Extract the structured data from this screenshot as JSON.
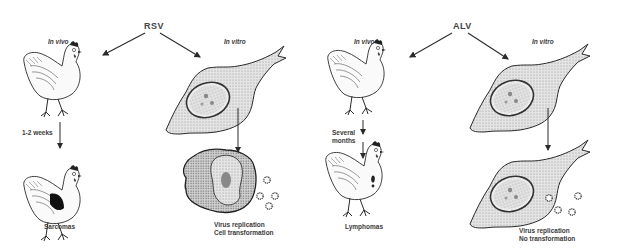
{
  "panels": [
    {
      "virus": "RSV",
      "in_vivo_label": "In vivo",
      "in_vitro_label": "In vitro",
      "time_label": "1-2 weeks",
      "vivo_outcome": "Sarcomas",
      "vitro_outcome_line1": "Virus replication",
      "vitro_outcome_line2": "Cell transformation"
    },
    {
      "virus": "ALV",
      "in_vivo_label": "In vivo",
      "in_vitro_label": "In vitro",
      "time_label_line1": "Several",
      "time_label_line2": "months",
      "vivo_outcome": "Lymphomas",
      "vitro_outcome_line1": "Virus replication",
      "vitro_outcome_line2": "No transformation"
    }
  ],
  "icons": [
    "chicken-icon",
    "fibroblast-cell-icon",
    "transformed-cell-icon",
    "virus-particle-icon",
    "arrow-icon"
  ],
  "colors": {
    "ink": "#2a2a2a",
    "cell_fill": "#d9d9d9",
    "nucleus_fill": "#e8e8e8",
    "tumor": "#111111"
  }
}
